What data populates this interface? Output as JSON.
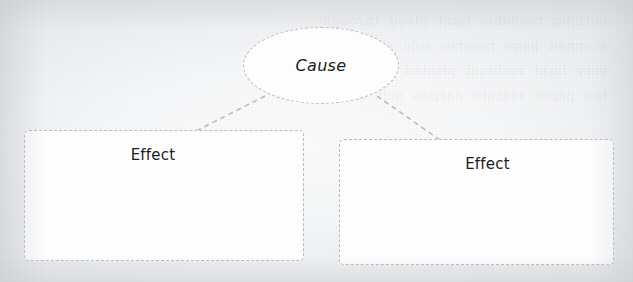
{
  "diagram": {
    "type": "cause-and-effect",
    "background_color": "#f4f5f6",
    "stroke_color": "#b6b9bd",
    "text_color": "#1b1d20",
    "node_fill": "#fdfdfe",
    "cause": {
      "label": "Cause",
      "shape": "ellipse",
      "style": "dashed",
      "italic": true
    },
    "effects": [
      {
        "label": "Effect",
        "shape": "rounded-rectangle",
        "style": "dashed",
        "position": "left"
      },
      {
        "label": "Effect",
        "shape": "rounded-rectangle",
        "style": "dashed",
        "position": "right"
      }
    ],
    "connectors": [
      {
        "from": "Cause",
        "to": "Effect-left",
        "style": "dashed"
      },
      {
        "from": "Cause",
        "to": "Effect-right",
        "style": "dashed"
      }
    ],
    "ghost_text": "nothing  readable  faint  bleed  through\nscanned  page  reverse  side  showing\nvery  light  residual  printed  lines  here\nthe  paper  texture  carries  soft  marks"
  }
}
